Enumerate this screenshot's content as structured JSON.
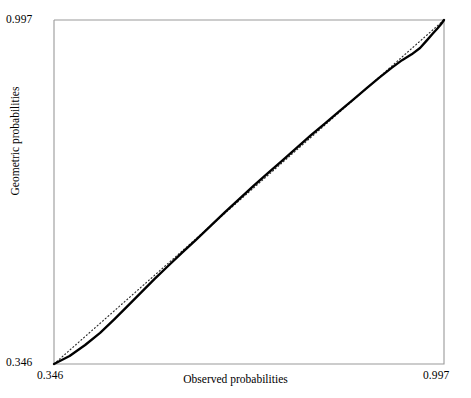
{
  "chart_data": {
    "type": "line",
    "title": "",
    "subtitle": "",
    "xlabel": "Observed probabilities",
    "ylabel": "Geometric probabilities",
    "xlim": [
      0.346,
      0.997
    ],
    "ylim": [
      0.346,
      0.997
    ],
    "xticks": [
      "0.346",
      "0.997"
    ],
    "yticks": [
      "0.346",
      "0.997"
    ],
    "grid": false,
    "legend": false,
    "legend_position": "none",
    "frame": {
      "color": "#9a9a9a",
      "left_px": 54,
      "right_px": 444,
      "top_px": 20,
      "bottom_px": 364
    },
    "series": [
      {
        "name": "Reference line",
        "style": "dotted",
        "color": "#2b2b2b",
        "x": [
          0.346,
          0.997
        ],
        "y": [
          0.346,
          0.997
        ]
      },
      {
        "name": "P-P curve",
        "style": "solid",
        "color": "#000000",
        "x": [
          0.346,
          0.372,
          0.398,
          0.423,
          0.447,
          0.47,
          0.492,
          0.514,
          0.536,
          0.559,
          0.583,
          0.607,
          0.631,
          0.655,
          0.679,
          0.703,
          0.727,
          0.751,
          0.775,
          0.799,
          0.822,
          0.845,
          0.868,
          0.889,
          0.909,
          0.927,
          0.943,
          0.957,
          0.968,
          0.978,
          0.986,
          0.992,
          0.997
        ],
        "y": [
          0.346,
          0.361,
          0.382,
          0.405,
          0.431,
          0.457,
          0.482,
          0.507,
          0.531,
          0.556,
          0.581,
          0.607,
          0.633,
          0.658,
          0.683,
          0.707,
          0.731,
          0.755,
          0.779,
          0.802,
          0.824,
          0.846,
          0.868,
          0.888,
          0.906,
          0.921,
          0.932,
          0.944,
          0.958,
          0.971,
          0.981,
          0.989,
          0.997
        ]
      }
    ]
  },
  "axes": {
    "x_title": "Observed probabilities",
    "y_title": "Geometric probabilities",
    "x_min_label": "0.346",
    "x_max_label": "0.997",
    "y_min_label": "0.346",
    "y_max_label": "0.997"
  },
  "colors": {
    "frame": "#9a9a9a",
    "curve": "#000000",
    "reference": "#2b2b2b",
    "background": "#ffffff",
    "text": "#000000"
  }
}
